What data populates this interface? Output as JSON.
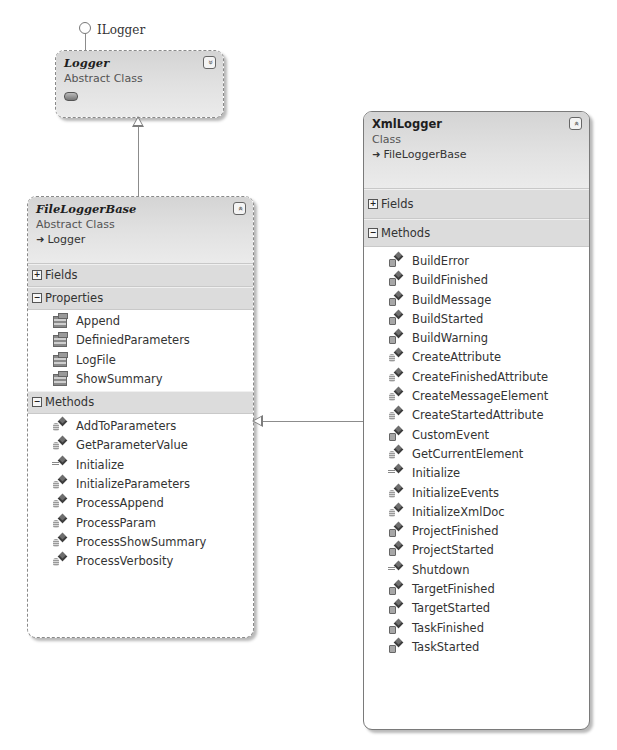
{
  "interface": {
    "label": "ILogger"
  },
  "classes": {
    "logger": {
      "name": "Logger",
      "kind": "Abstract Class",
      "collapsed": true,
      "toggle": "expand"
    },
    "file_logger_base": {
      "name": "FileLoggerBase",
      "kind": "Abstract Class",
      "base": "Logger",
      "toggle": "collapse",
      "sections": {
        "fields": {
          "label": "Fields",
          "expanded": false
        },
        "properties": {
          "label": "Properties",
          "expanded": true,
          "items": [
            "Append",
            "DefiniedParameters",
            "LogFile",
            "ShowSummary"
          ]
        },
        "methods": {
          "label": "Methods",
          "expanded": true,
          "items": [
            {
              "name": "AddToParameters",
              "access": "private"
            },
            {
              "name": "GetParameterValue",
              "access": "private"
            },
            {
              "name": "Initialize",
              "access": "public"
            },
            {
              "name": "InitializeParameters",
              "access": "private"
            },
            {
              "name": "ProcessAppend",
              "access": "private"
            },
            {
              "name": "ProcessParam",
              "access": "private"
            },
            {
              "name": "ProcessShowSummary",
              "access": "private"
            },
            {
              "name": "ProcessVerbosity",
              "access": "private"
            }
          ]
        }
      }
    },
    "xml_logger": {
      "name": "XmlLogger",
      "kind": "Class",
      "base": "FileLoggerBase",
      "toggle": "collapse",
      "sections": {
        "fields": {
          "label": "Fields",
          "expanded": false
        },
        "methods": {
          "label": "Methods",
          "expanded": true,
          "items": [
            {
              "name": "BuildError",
              "access": "protected"
            },
            {
              "name": "BuildFinished",
              "access": "protected"
            },
            {
              "name": "BuildMessage",
              "access": "protected"
            },
            {
              "name": "BuildStarted",
              "access": "protected"
            },
            {
              "name": "BuildWarning",
              "access": "protected"
            },
            {
              "name": "CreateAttribute",
              "access": "private"
            },
            {
              "name": "CreateFinishedAttribute",
              "access": "private"
            },
            {
              "name": "CreateMessageElement",
              "access": "private"
            },
            {
              "name": "CreateStartedAttribute",
              "access": "private"
            },
            {
              "name": "CustomEvent",
              "access": "protected"
            },
            {
              "name": "GetCurrentElement",
              "access": "private"
            },
            {
              "name": "Initialize",
              "access": "public"
            },
            {
              "name": "InitializeEvents",
              "access": "private"
            },
            {
              "name": "InitializeXmlDoc",
              "access": "private"
            },
            {
              "name": "ProjectFinished",
              "access": "protected"
            },
            {
              "name": "ProjectStarted",
              "access": "protected"
            },
            {
              "name": "Shutdown",
              "access": "public"
            },
            {
              "name": "TargetFinished",
              "access": "protected"
            },
            {
              "name": "TargetStarted",
              "access": "protected"
            },
            {
              "name": "TaskFinished",
              "access": "protected"
            },
            {
              "name": "TaskStarted",
              "access": "protected"
            }
          ]
        }
      }
    }
  },
  "glyphs": {
    "expand": "»",
    "collapse": "«",
    "plus": "+",
    "minus": "−",
    "inherits_arrow": "➜"
  },
  "relationships": [
    {
      "from": "Logger",
      "to": "ILogger",
      "type": "implements"
    },
    {
      "from": "FileLoggerBase",
      "to": "Logger",
      "type": "inherits"
    },
    {
      "from": "XmlLogger",
      "to": "FileLoggerBase",
      "type": "inherits"
    }
  ]
}
